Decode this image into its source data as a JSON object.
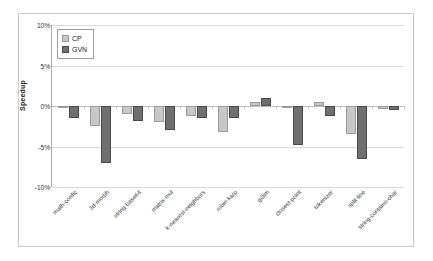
{
  "chart_data": {
    "type": "bar",
    "title": "",
    "xlabel": "",
    "ylabel": "Speedup",
    "ylim": [
      -10,
      10
    ],
    "ytick_labels": [
      "10%",
      "5%",
      "0%",
      "-5%",
      "-10%"
    ],
    "ytick_values": [
      10,
      5,
      0,
      -5,
      -10
    ],
    "grid": true,
    "legend_position": "top-left",
    "categories": [
      "math-cordic",
      "3d-morph",
      "string-base64",
      "matrix-mul",
      "k-nearest-neighbors",
      "robin-karp",
      "gclim",
      "closest-point",
      "tokenizer",
      "split-line",
      "string-contains-char"
    ],
    "series": [
      {
        "name": "CP",
        "color": "#c7c7c7",
        "values": [
          -0.2,
          -2.5,
          -1.0,
          -2.0,
          -1.2,
          -3.2,
          0.5,
          -0.3,
          0.5,
          -3.5,
          -0.4
        ]
      },
      {
        "name": "GVN",
        "color": "#6f6f6f",
        "values": [
          -1.5,
          -7.0,
          -1.8,
          -3.0,
          -1.5,
          -1.5,
          1.0,
          -4.8,
          -1.2,
          -6.5,
          -0.5
        ]
      }
    ]
  }
}
